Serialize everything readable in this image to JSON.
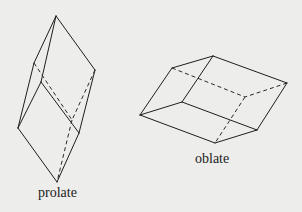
{
  "figure": {
    "shapes": [
      {
        "id": "prolate",
        "label": "prolate",
        "visible_edges": [
          [
            [
              56,
              16
            ],
            [
              34,
              63
            ]
          ],
          [
            [
              56,
              16
            ],
            [
              41,
              82
            ]
          ],
          [
            [
              56,
              16
            ],
            [
              95,
              70
            ]
          ],
          [
            [
              34,
              63
            ],
            [
              18,
              128
            ]
          ],
          [
            [
              41,
              82
            ],
            [
              18,
              128
            ]
          ],
          [
            [
              41,
              82
            ],
            [
              79,
              133
            ]
          ],
          [
            [
              95,
              70
            ],
            [
              79,
              133
            ]
          ],
          [
            [
              18,
              128
            ],
            [
              57,
              182
            ]
          ],
          [
            [
              79,
              133
            ],
            [
              57,
              182
            ]
          ]
        ],
        "hidden_edges": [
          [
            [
              34,
              63
            ],
            [
              72,
              120
            ]
          ],
          [
            [
              95,
              70
            ],
            [
              72,
              120
            ]
          ],
          [
            [
              72,
              120
            ],
            [
              57,
              182
            ]
          ]
        ]
      },
      {
        "id": "oblate",
        "label": "oblate",
        "visible_edges": [
          [
            [
              172,
              68
            ],
            [
              213,
              56
            ]
          ],
          [
            [
              213,
              56
            ],
            [
              287,
              83
            ]
          ],
          [
            [
              172,
              68
            ],
            [
              140,
              115
            ]
          ],
          [
            [
              213,
              56
            ],
            [
              182,
              102
            ]
          ],
          [
            [
              182,
              102
            ],
            [
              140,
              115
            ]
          ],
          [
            [
              182,
              102
            ],
            [
              257,
              130
            ]
          ],
          [
            [
              287,
              83
            ],
            [
              257,
              130
            ]
          ],
          [
            [
              140,
              115
            ],
            [
              215,
              143
            ]
          ],
          [
            [
              215,
              143
            ],
            [
              257,
              130
            ]
          ]
        ],
        "hidden_edges": [
          [
            [
              172,
              68
            ],
            [
              245,
              97
            ]
          ],
          [
            [
              287,
              83
            ],
            [
              245,
              97
            ]
          ],
          [
            [
              245,
              97
            ],
            [
              215,
              143
            ]
          ]
        ]
      }
    ]
  },
  "labels": {
    "prolate": "prolate",
    "oblate": "oblate"
  }
}
